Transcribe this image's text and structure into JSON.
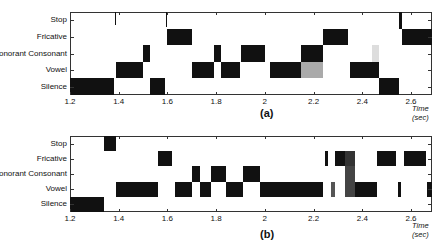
{
  "chart_data": [
    {
      "type": "heatmap",
      "title": "",
      "caption": "(a)",
      "xlabel": "Time (sec)",
      "ylabel": "",
      "xlim": [
        1.2,
        2.7
      ],
      "xticks": [
        "1.2",
        "1.4",
        "1.6",
        "1.8",
        "2",
        "2.2",
        "2.4",
        "2.6"
      ],
      "categories": [
        "Stop",
        "Fricative",
        "Sonorant Consonant",
        "Vowel",
        "Silence"
      ],
      "segments": [
        {
          "class": "Silence",
          "start": 1.2,
          "end": 1.38,
          "shade": "#111111"
        },
        {
          "class": "Stop",
          "start": 1.383,
          "end": 1.387,
          "shade": "#111111",
          "partial": 0.5
        },
        {
          "class": "Vowel",
          "start": 1.39,
          "end": 1.5,
          "shade": "#111111"
        },
        {
          "class": "Sonorant Consonant",
          "start": 1.5,
          "end": 1.53,
          "shade": "#111111"
        },
        {
          "class": "Silence",
          "start": 1.53,
          "end": 1.59,
          "shade": "#111111"
        },
        {
          "class": "Stop",
          "start": 1.593,
          "end": 1.597,
          "shade": "#111111",
          "partial": 0.6
        },
        {
          "class": "Fricative",
          "start": 1.6,
          "end": 1.7,
          "shade": "#111111"
        },
        {
          "class": "Vowel",
          "start": 1.7,
          "end": 1.79,
          "shade": "#111111"
        },
        {
          "class": "Sonorant Consonant",
          "start": 1.79,
          "end": 1.82,
          "shade": "#111111"
        },
        {
          "class": "Vowel",
          "start": 1.82,
          "end": 1.9,
          "shade": "#111111"
        },
        {
          "class": "Sonorant Consonant",
          "start": 1.9,
          "end": 2.0,
          "shade": "#111111"
        },
        {
          "class": "Vowel",
          "start": 2.02,
          "end": 2.15,
          "shade": "#111111"
        },
        {
          "class": "Sonorant Consonant",
          "start": 2.15,
          "end": 2.24,
          "shade": "#111111"
        },
        {
          "class": "Vowel",
          "start": 2.15,
          "end": 2.24,
          "shade": "#aaaaaa"
        },
        {
          "class": "Fricative",
          "start": 2.24,
          "end": 2.34,
          "shade": "#111111"
        },
        {
          "class": "Vowel",
          "start": 2.35,
          "end": 2.47,
          "shade": "#111111"
        },
        {
          "class": "Sonorant Consonant",
          "start": 2.44,
          "end": 2.47,
          "shade": "#dddddd"
        },
        {
          "class": "Silence",
          "start": 2.47,
          "end": 2.55,
          "shade": "#111111"
        },
        {
          "class": "Stop",
          "start": 2.55,
          "end": 2.565,
          "shade": "#111111"
        },
        {
          "class": "Fricative",
          "start": 2.565,
          "end": 2.7,
          "shade": "#111111"
        }
      ]
    },
    {
      "type": "heatmap",
      "title": "",
      "caption": "(b)",
      "xlabel": "Time (sec)",
      "ylabel": "",
      "xlim": [
        1.2,
        2.7
      ],
      "xticks": [
        "1.2",
        "1.4",
        "1.6",
        "1.8",
        "2",
        "2.2",
        "2.4",
        "2.6"
      ],
      "categories": [
        "Stop",
        "Fricative",
        "Sonorant Consonant",
        "Vowel",
        "Silence"
      ],
      "segments": [
        {
          "class": "Silence",
          "start": 1.2,
          "end": 1.34,
          "shade": "#111111"
        },
        {
          "class": "Stop",
          "start": 1.34,
          "end": 1.39,
          "shade": "#111111"
        },
        {
          "class": "Vowel",
          "start": 1.39,
          "end": 1.56,
          "shade": "#111111"
        },
        {
          "class": "Fricative",
          "start": 1.56,
          "end": 1.62,
          "shade": "#111111"
        },
        {
          "class": "Vowel",
          "start": 1.63,
          "end": 1.7,
          "shade": "#111111"
        },
        {
          "class": "Sonorant Consonant",
          "start": 1.7,
          "end": 1.735,
          "shade": "#111111"
        },
        {
          "class": "Vowel",
          "start": 1.735,
          "end": 1.78,
          "shade": "#111111"
        },
        {
          "class": "Sonorant Consonant",
          "start": 1.78,
          "end": 1.84,
          "shade": "#111111"
        },
        {
          "class": "Vowel",
          "start": 1.84,
          "end": 1.91,
          "shade": "#111111"
        },
        {
          "class": "Sonorant Consonant",
          "start": 1.91,
          "end": 1.98,
          "shade": "#111111"
        },
        {
          "class": "Vowel",
          "start": 1.98,
          "end": 2.24,
          "shade": "#111111"
        },
        {
          "class": "Fricative",
          "start": 2.245,
          "end": 2.26,
          "shade": "#111111"
        },
        {
          "class": "Vowel",
          "start": 2.27,
          "end": 2.29,
          "shade": "#555555"
        },
        {
          "class": "Fricative",
          "start": 2.29,
          "end": 2.33,
          "shade": "#111111"
        },
        {
          "class": "Fricative",
          "start": 2.33,
          "end": 2.37,
          "shade": "#333333"
        },
        {
          "class": "Sonorant Consonant",
          "start": 2.33,
          "end": 2.37,
          "shade": "#444444"
        },
        {
          "class": "Vowel",
          "start": 2.33,
          "end": 2.37,
          "shade": "#444444"
        },
        {
          "class": "Vowel",
          "start": 2.37,
          "end": 2.46,
          "shade": "#111111"
        },
        {
          "class": "Fricative",
          "start": 2.46,
          "end": 2.54,
          "shade": "#111111"
        },
        {
          "class": "Vowel",
          "start": 2.545,
          "end": 2.56,
          "shade": "#111111"
        },
        {
          "class": "Fricative",
          "start": 2.57,
          "end": 2.66,
          "shade": "#111111"
        },
        {
          "class": "Vowel",
          "start": 2.665,
          "end": 2.7,
          "shade": "#111111"
        }
      ]
    }
  ]
}
